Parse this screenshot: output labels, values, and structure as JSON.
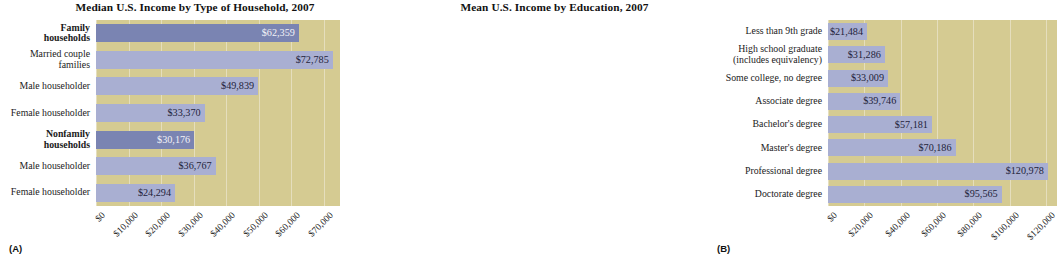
{
  "figure": {
    "panel_a_letter": "(A)",
    "panel_b_letter": "(B)"
  },
  "colors": {
    "plot_background": "#d5cb92",
    "bar": "#a9afd2",
    "bar_accent": "#7a84b2",
    "gridline": "#e7e2c4",
    "text": "#1a1a1a",
    "label_on_dark": "#f2f2f7"
  },
  "chart_data": [
    {
      "type": "bar",
      "orientation": "horizontal",
      "panel": "(A)",
      "title": "Median U.S. Income by Type of Household, 2007",
      "xlabel": "",
      "ylabel": "",
      "xlim": [
        0,
        75000
      ],
      "grid": true,
      "legend": "none",
      "tick_labels": [
        "$0",
        "$10,000",
        "$20,000",
        "$30,000",
        "$40,000",
        "$50,000",
        "$60,000",
        "$70,000"
      ],
      "tick_values": [
        0,
        10000,
        20000,
        30000,
        40000,
        50000,
        60000,
        70000
      ],
      "categories": [
        "Family households",
        "Married couple families",
        "Male householder",
        "Female householder",
        "Nonfamily households",
        "Male householder",
        "Female householder"
      ],
      "category_lines": [
        [
          "Family",
          "households"
        ],
        [
          "Married couple",
          "families"
        ],
        [
          "Male householder"
        ],
        [
          "Female householder"
        ],
        [
          "Nonfamily",
          "households"
        ],
        [
          "Male householder"
        ],
        [
          "Female householder"
        ]
      ],
      "category_emphasis": [
        true,
        false,
        false,
        false,
        true,
        false,
        false
      ],
      "values": [
        62359,
        72785,
        49839,
        33370,
        30176,
        36767,
        24294
      ],
      "value_labels": [
        "$62,359",
        "$72,785",
        "$49,839",
        "$33,370",
        "$30,176",
        "$36,767",
        "$24,294"
      ]
    },
    {
      "type": "bar",
      "orientation": "horizontal",
      "panel": "(B)",
      "title": "Mean U.S. Income by Education, 2007",
      "xlabel": "",
      "ylabel": "",
      "xlim": [
        0,
        126000
      ],
      "grid": true,
      "legend": "none",
      "tick_labels": [
        "$0",
        "$20,000",
        "$40,000",
        "$60,000",
        "$80,000",
        "$100,000",
        "$120,000"
      ],
      "tick_values": [
        0,
        20000,
        40000,
        60000,
        80000,
        100000,
        120000
      ],
      "categories": [
        "Less than 9th grade",
        "High school graduate (includes equivalency)",
        "Some college, no degree",
        "Associate degree",
        "Bachelor's degree",
        "Master's degree",
        "Professional degree",
        "Doctorate degree"
      ],
      "category_lines": [
        [
          "Less than 9th grade"
        ],
        [
          "High school graduate",
          "(includes equivalency)"
        ],
        [
          "Some college, no degree"
        ],
        [
          "Associate degree"
        ],
        [
          "Bachelor's degree"
        ],
        [
          "Master's degree"
        ],
        [
          "Professional degree"
        ],
        [
          "Doctorate degree"
        ]
      ],
      "category_emphasis": [
        false,
        false,
        false,
        false,
        false,
        false,
        false,
        false
      ],
      "values": [
        21484,
        31286,
        33009,
        39746,
        57181,
        70186,
        120978,
        95565
      ],
      "value_labels": [
        "$21,484",
        "$31,286",
        "$33,009",
        "$39,746",
        "$57,181",
        "$70,186",
        "$120,978",
        "$95,565"
      ]
    }
  ]
}
